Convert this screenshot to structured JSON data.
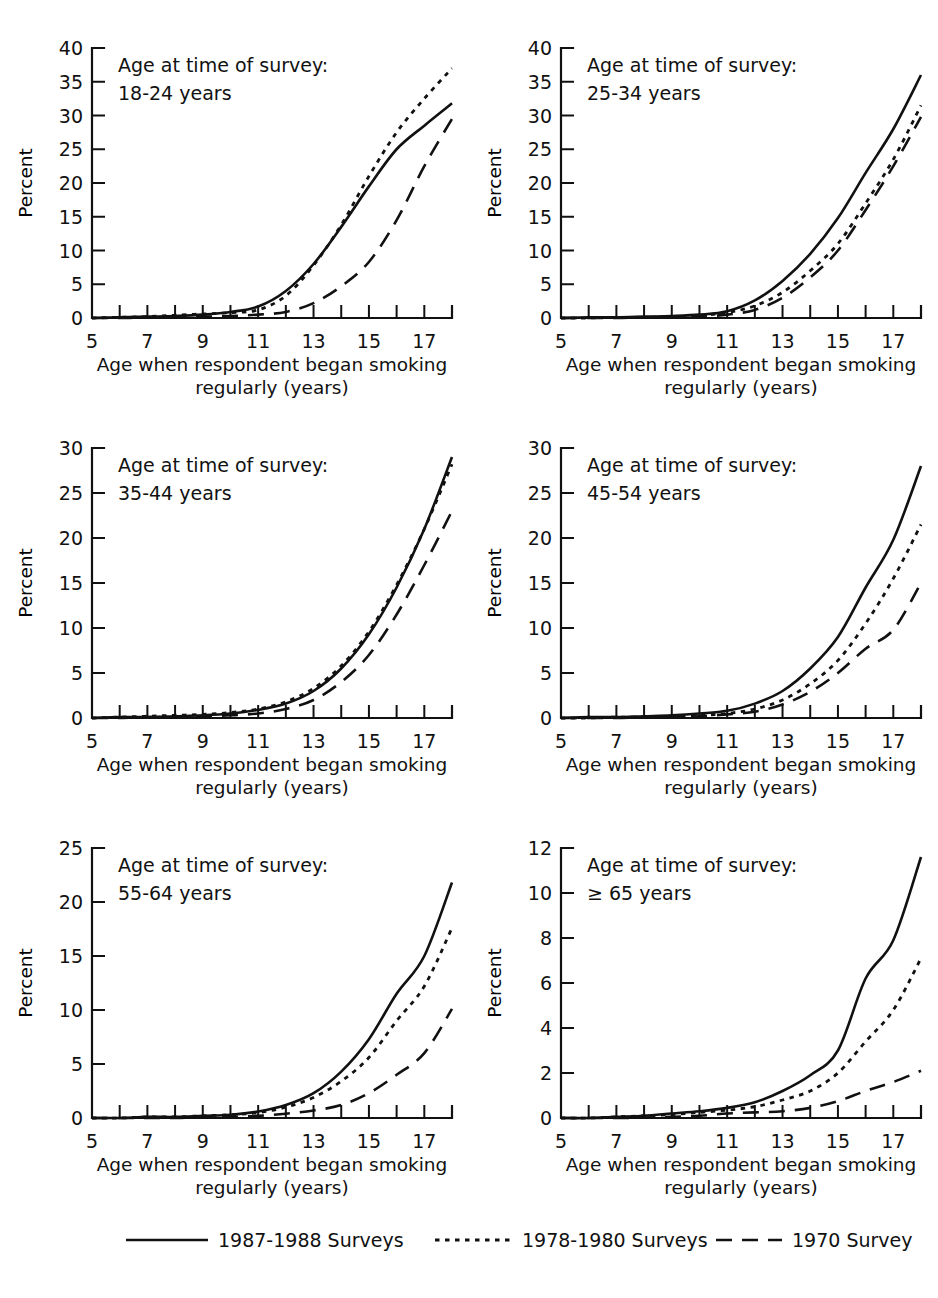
{
  "figure": {
    "background_color": "#ffffff",
    "ink_color": "#111111",
    "panel_count": 6
  },
  "axes_common": {
    "xlabel_line1": "Age when respondent began smoking",
    "xlabel_line2": "regularly (years)",
    "ylabel": "Percent",
    "note_prefix": "Age at time of survey:",
    "x_ticks_all": [
      5,
      6,
      7,
      8,
      9,
      10,
      11,
      12,
      13,
      14,
      15,
      16,
      17,
      18
    ],
    "x_tick_labels": [
      "5",
      "7",
      "9",
      "11",
      "13",
      "15",
      "17"
    ],
    "x_tick_label_values": [
      5,
      7,
      9,
      11,
      13,
      15,
      17
    ],
    "xlim": [
      5,
      18
    ]
  },
  "legend": {
    "position": "bottom-center",
    "entries": [
      {
        "label": "1987-1988 Surveys",
        "style": "solid"
      },
      {
        "label": "1978-1980 Surveys",
        "style": "dotted"
      },
      {
        "label": "1970 Survey",
        "style": "dashed"
      }
    ]
  },
  "chart_data": [
    {
      "type": "line",
      "panel_index": 0,
      "panel_position": "top-left",
      "title": "",
      "note": "18-24 years",
      "note_prefix": "Age at time of survey:",
      "xlabel": "Age when respondent began smoking regularly (years)",
      "ylabel": "Percent",
      "xlim": [
        5,
        18
      ],
      "ylim": [
        0,
        40
      ],
      "y_ticks": [
        0,
        5,
        10,
        15,
        20,
        25,
        30,
        35,
        40
      ],
      "y_tick_labels": [
        "0",
        "5",
        "10",
        "15",
        "20",
        "25",
        "30",
        "35",
        "40"
      ],
      "grid": false,
      "x": [
        5,
        6,
        7,
        8,
        9,
        10,
        11,
        12,
        13,
        14,
        15,
        16,
        17,
        18
      ],
      "series": [
        {
          "name": "1987-1988 Surveys",
          "style": "solid",
          "values": [
            0.0,
            0.1,
            0.2,
            0.3,
            0.5,
            0.9,
            1.7,
            4.0,
            8.0,
            13.5,
            19.5,
            25.0,
            28.5,
            31.8
          ]
        },
        {
          "name": "1978-1980 Surveys",
          "style": "dotted",
          "values": [
            0.0,
            0.1,
            0.2,
            0.4,
            0.6,
            0.8,
            1.2,
            3.3,
            7.8,
            13.8,
            21.0,
            27.5,
            32.5,
            37.0
          ]
        },
        {
          "name": "1970 Survey",
          "style": "dashed",
          "values": [
            0.0,
            0.0,
            0.1,
            0.1,
            0.2,
            0.3,
            0.5,
            0.9,
            2.2,
            4.7,
            8.3,
            14.5,
            22.5,
            29.5
          ]
        }
      ]
    },
    {
      "type": "line",
      "panel_index": 1,
      "panel_position": "top-right",
      "title": "",
      "note": "25-34 years",
      "note_prefix": "Age at time of survey:",
      "xlabel": "Age when respondent began smoking regularly (years)",
      "ylabel": "Percent",
      "xlim": [
        5,
        18
      ],
      "ylim": [
        0,
        40
      ],
      "y_ticks": [
        0,
        5,
        10,
        15,
        20,
        25,
        30,
        35,
        40
      ],
      "y_tick_labels": [
        "0",
        "5",
        "10",
        "15",
        "20",
        "25",
        "30",
        "35",
        "40"
      ],
      "grid": false,
      "x": [
        5,
        6,
        7,
        8,
        9,
        10,
        11,
        12,
        13,
        14,
        15,
        16,
        17,
        18
      ],
      "series": [
        {
          "name": "1987-1988 Surveys",
          "style": "solid",
          "values": [
            0.0,
            0.1,
            0.1,
            0.2,
            0.3,
            0.5,
            1.0,
            2.6,
            5.5,
            9.5,
            14.8,
            21.5,
            28.0,
            36.0
          ]
        },
        {
          "name": "1978-1980 Surveys",
          "style": "dotted",
          "values": [
            0.0,
            0.0,
            0.1,
            0.1,
            0.2,
            0.4,
            0.8,
            1.8,
            3.8,
            7.0,
            11.0,
            17.0,
            23.5,
            31.5
          ]
        },
        {
          "name": "1970 Survey",
          "style": "dashed",
          "values": [
            0.0,
            0.0,
            0.0,
            0.1,
            0.1,
            0.2,
            0.5,
            1.2,
            3.0,
            6.0,
            10.0,
            16.0,
            22.5,
            29.8
          ]
        }
      ]
    },
    {
      "type": "line",
      "panel_index": 2,
      "panel_position": "middle-left",
      "title": "",
      "note": "35-44 years",
      "note_prefix": "Age at time of survey:",
      "xlabel": "Age when respondent began smoking regularly (years)",
      "ylabel": "Percent",
      "xlim": [
        5,
        18
      ],
      "ylim": [
        0,
        30
      ],
      "y_ticks": [
        0,
        5,
        10,
        15,
        20,
        25,
        30
      ],
      "y_tick_labels": [
        "0",
        "5",
        "10",
        "15",
        "20",
        "25",
        "30"
      ],
      "grid": false,
      "x": [
        5,
        6,
        7,
        8,
        9,
        10,
        11,
        12,
        13,
        14,
        15,
        16,
        17,
        18
      ],
      "series": [
        {
          "name": "1987-1988 Surveys",
          "style": "solid",
          "values": [
            0.0,
            0.1,
            0.1,
            0.2,
            0.3,
            0.5,
            0.9,
            1.6,
            3.0,
            5.5,
            9.3,
            14.5,
            21.0,
            29.0
          ]
        },
        {
          "name": "1978-1980 Surveys",
          "style": "dotted",
          "values": [
            0.0,
            0.1,
            0.2,
            0.3,
            0.4,
            0.6,
            1.0,
            1.8,
            3.3,
            5.8,
            9.6,
            14.8,
            21.0,
            28.2
          ]
        },
        {
          "name": "1970 Survey",
          "style": "dashed",
          "values": [
            0.0,
            0.0,
            0.1,
            0.1,
            0.2,
            0.3,
            0.5,
            1.0,
            2.0,
            4.0,
            7.0,
            11.5,
            17.0,
            23.0
          ]
        }
      ]
    },
    {
      "type": "line",
      "panel_index": 3,
      "panel_position": "middle-right",
      "title": "",
      "note": "45-54 years",
      "note_prefix": "Age at time of survey:",
      "xlabel": "Age when respondent began smoking regularly (years)",
      "ylabel": "Percent",
      "xlim": [
        5,
        18
      ],
      "ylim": [
        0,
        30
      ],
      "y_ticks": [
        0,
        5,
        10,
        15,
        20,
        25,
        30
      ],
      "y_tick_labels": [
        "0",
        "5",
        "10",
        "15",
        "20",
        "25",
        "30"
      ],
      "grid": false,
      "x": [
        5,
        6,
        7,
        8,
        9,
        10,
        11,
        12,
        13,
        14,
        15,
        16,
        17,
        18
      ],
      "series": [
        {
          "name": "1987-1988 Surveys",
          "style": "solid",
          "values": [
            0.0,
            0.1,
            0.1,
            0.2,
            0.3,
            0.5,
            0.8,
            1.6,
            3.0,
            5.5,
            9.0,
            14.5,
            19.8,
            28.0
          ]
        },
        {
          "name": "1978-1980 Surveys",
          "style": "dotted",
          "values": [
            0.0,
            0.0,
            0.1,
            0.1,
            0.2,
            0.3,
            0.5,
            1.0,
            2.0,
            3.8,
            6.4,
            10.5,
            15.5,
            21.5
          ]
        },
        {
          "name": "1970 Survey",
          "style": "dashed",
          "values": [
            0.0,
            0.0,
            0.0,
            0.1,
            0.1,
            0.2,
            0.4,
            0.7,
            1.5,
            2.9,
            5.0,
            7.7,
            9.8,
            15.0
          ]
        }
      ]
    },
    {
      "type": "line",
      "panel_index": 4,
      "panel_position": "bottom-left",
      "title": "",
      "note": "55-64 years",
      "note_prefix": "Age at time of survey:",
      "xlabel": "Age when respondent began smoking regularly (years)",
      "ylabel": "Percent",
      "xlim": [
        5,
        18
      ],
      "ylim": [
        0,
        25
      ],
      "y_ticks": [
        0,
        5,
        10,
        15,
        20,
        25
      ],
      "y_tick_labels": [
        "0",
        "5",
        "10",
        "15",
        "20",
        "25"
      ],
      "grid": false,
      "x": [
        5,
        6,
        7,
        8,
        9,
        10,
        11,
        12,
        13,
        14,
        15,
        16,
        17,
        18
      ],
      "series": [
        {
          "name": "1987-1988 Surveys",
          "style": "solid",
          "values": [
            0.0,
            0.0,
            0.1,
            0.1,
            0.2,
            0.3,
            0.6,
            1.2,
            2.3,
            4.3,
            7.3,
            11.5,
            15.0,
            21.8
          ]
        },
        {
          "name": "1978-1980 Surveys",
          "style": "dotted",
          "values": [
            0.0,
            0.0,
            0.1,
            0.1,
            0.2,
            0.3,
            0.5,
            1.0,
            1.9,
            3.4,
            5.6,
            9.0,
            12.2,
            17.6
          ]
        },
        {
          "name": "1970 Survey",
          "style": "dashed",
          "values": [
            0.0,
            0.0,
            0.0,
            0.0,
            0.1,
            0.1,
            0.2,
            0.4,
            0.7,
            1.2,
            2.3,
            4.0,
            6.0,
            10.1
          ]
        }
      ]
    },
    {
      "type": "line",
      "panel_index": 5,
      "panel_position": "bottom-right",
      "title": "",
      "note": "≥ 65 years",
      "note_prefix": "Age at time of survey:",
      "xlabel": "Age when respondent began smoking regularly (years)",
      "ylabel": "Percent",
      "xlim": [
        5,
        18
      ],
      "ylim": [
        0,
        12
      ],
      "y_ticks": [
        0,
        2,
        4,
        6,
        8,
        10,
        12
      ],
      "y_tick_labels": [
        "0",
        "2",
        "4",
        "6",
        "8",
        "10",
        "12"
      ],
      "grid": false,
      "x": [
        5,
        6,
        7,
        8,
        9,
        10,
        11,
        12,
        13,
        14,
        15,
        16,
        17,
        18
      ],
      "series": [
        {
          "name": "1987-1988 Surveys",
          "style": "solid",
          "values": [
            0.0,
            0.0,
            0.05,
            0.1,
            0.2,
            0.3,
            0.45,
            0.7,
            1.2,
            1.9,
            3.0,
            6.2,
            7.9,
            11.6
          ]
        },
        {
          "name": "1978-1980 Surveys",
          "style": "dotted",
          "values": [
            0.0,
            0.0,
            0.05,
            0.1,
            0.15,
            0.25,
            0.35,
            0.5,
            0.8,
            1.2,
            2.0,
            3.4,
            4.8,
            7.1
          ]
        },
        {
          "name": "1970 Survey",
          "style": "dashed",
          "values": [
            0.0,
            0.0,
            0.0,
            0.02,
            0.05,
            0.1,
            0.2,
            0.25,
            0.3,
            0.45,
            0.75,
            1.2,
            1.6,
            2.1
          ]
        }
      ]
    }
  ]
}
